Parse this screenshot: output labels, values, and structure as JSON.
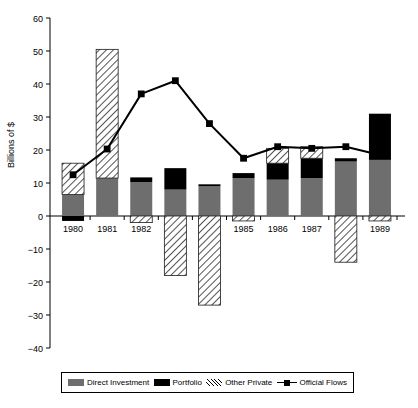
{
  "chart_data": {
    "type": "bar",
    "title": "",
    "subtitle": "",
    "xlabel": "",
    "ylabel": "Billions of $",
    "ylim": [
      -40,
      60
    ],
    "ytick_step": 10,
    "yticks": [
      60,
      50,
      40,
      30,
      20,
      10,
      0,
      -10,
      -20,
      -30,
      -40
    ],
    "ytick_labels": [
      "60",
      "50",
      "40",
      "30",
      "20",
      "10",
      "0",
      "−10",
      "−20",
      "−30",
      "−40"
    ],
    "grid": false,
    "stacked": true,
    "legend_position": "bottom",
    "categories": [
      "1980",
      "1981",
      "1982",
      "1983",
      "1984",
      "1985",
      "1986",
      "1987",
      "1988",
      "1989"
    ],
    "series": [
      {
        "name": "Direct Investment",
        "kind": "bar",
        "color": "#6e6e6e",
        "pattern": "solid",
        "values": [
          6.5,
          11.5,
          10.3,
          8.0,
          9.0,
          11.5,
          11.0,
          11.5,
          16.5,
          17.0
        ]
      },
      {
        "name": "Portfolio",
        "kind": "bar",
        "color": "#000000",
        "pattern": "solid",
        "values": [
          -1.5,
          0.0,
          1.4,
          6.5,
          0.6,
          1.5,
          5.0,
          6.0,
          1.0,
          14.0
        ]
      },
      {
        "name": "Other Private",
        "kind": "bar",
        "color": "#ffffff",
        "pattern": "diagonal-hatch",
        "values": [
          9.5,
          39.0,
          -2.0,
          -18.0,
          -27.0,
          -1.5,
          4.5,
          3.5,
          -14.0,
          -1.5
        ]
      },
      {
        "name": "Official Flows",
        "kind": "line",
        "color": "#000000",
        "marker": "square",
        "values": [
          12.5,
          20.3,
          37.0,
          41.0,
          28.0,
          17.5,
          21.0,
          20.5,
          21.0,
          18.5
        ]
      }
    ],
    "annotations": []
  },
  "legend": {
    "entries": [
      {
        "label": "Direct Investment",
        "swatch": "direct-investment-swatch"
      },
      {
        "label": "Portfolio",
        "swatch": "portfolio-swatch"
      },
      {
        "label": "Other Private",
        "swatch": "other-private-swatch"
      },
      {
        "label": "Official Flows",
        "swatch": "official-flows-swatch"
      }
    ]
  }
}
